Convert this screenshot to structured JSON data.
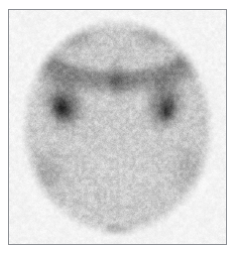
{
  "view": {
    "width": 236,
    "height": 256,
    "background_color": "#ffffff",
    "title": "Scintigraphy Planar Scan"
  },
  "frame": {
    "x": 8,
    "y": 9,
    "width": 219,
    "height": 236,
    "border_color": "#8b8e93",
    "border_width": 1,
    "fill_color": "#ffffff"
  },
  "scan": {
    "modality": "nuclear-medicine-scintigraphy",
    "colormap": "grayscale-inverted",
    "noise_label": "photon-counting speckle",
    "field_of_view": {
      "shape": "circle",
      "center_x": 118,
      "center_y": 128,
      "radius_x": 100,
      "radius_y": 112,
      "edge_softness": 16
    },
    "background_intensity": 0.1,
    "parenchyma_intensity": 0.38,
    "speckle_amplitude": 0.22,
    "speckle_scale": 3.2,
    "hotspots": [
      {
        "name": "superior-rim-band",
        "cx": 118,
        "cy": 46,
        "rx": 96,
        "ry": 44,
        "inner_rx": 74,
        "inner_ry": 26,
        "intensity": 0.3,
        "kind": "arc"
      },
      {
        "name": "left-focal-uptake",
        "cx": 64,
        "cy": 104,
        "rx": 28,
        "ry": 35,
        "rotation": -18,
        "intensity": 0.42,
        "kind": "blob"
      },
      {
        "name": "left-focal-core",
        "cx": 62,
        "cy": 110,
        "rx": 14,
        "ry": 19,
        "rotation": -14,
        "intensity": 0.3,
        "kind": "blob"
      },
      {
        "name": "right-focal-uptake",
        "cx": 166,
        "cy": 104,
        "rx": 26,
        "ry": 35,
        "rotation": 16,
        "intensity": 0.4,
        "kind": "blob"
      },
      {
        "name": "right-focal-core",
        "cx": 168,
        "cy": 112,
        "rx": 12,
        "ry": 17,
        "rotation": 12,
        "intensity": 0.28,
        "kind": "blob"
      },
      {
        "name": "midline-upper-streak",
        "cx": 118,
        "cy": 78,
        "rx": 16,
        "ry": 28,
        "rotation": 0,
        "intensity": 0.16,
        "kind": "blob"
      },
      {
        "name": "inferior-midline-spot",
        "cx": 117,
        "cy": 234,
        "rx": 22,
        "ry": 11,
        "rotation": 0,
        "intensity": 0.34,
        "kind": "blob"
      },
      {
        "name": "left-lateral-shade",
        "cx": 46,
        "cy": 176,
        "rx": 30,
        "ry": 36,
        "rotation": 0,
        "intensity": 0.12,
        "kind": "blob"
      },
      {
        "name": "right-lateral-shade",
        "cx": 190,
        "cy": 168,
        "rx": 26,
        "ry": 34,
        "rotation": 0,
        "intensity": 0.1,
        "kind": "blob"
      },
      {
        "name": "top-left-rim-dark",
        "cx": 72,
        "cy": 34,
        "rx": 34,
        "ry": 22,
        "rotation": 0,
        "intensity": 0.22,
        "kind": "blob"
      },
      {
        "name": "top-right-rim-dark",
        "cx": 160,
        "cy": 32,
        "rx": 36,
        "ry": 22,
        "rotation": 0,
        "intensity": 0.22,
        "kind": "blob"
      },
      {
        "name": "central-cold-region",
        "cx": 118,
        "cy": 170,
        "rx": 56,
        "ry": 52,
        "rotation": 0,
        "intensity": 0.92,
        "kind": "cold"
      }
    ]
  },
  "chart_data": {
    "type": "heatmap",
    "title": "Scintigraphy Planar Scan",
    "xlabel": "",
    "ylabel": "",
    "colormap": "gray_r",
    "value_range": [
      0,
      1
    ]
  }
}
